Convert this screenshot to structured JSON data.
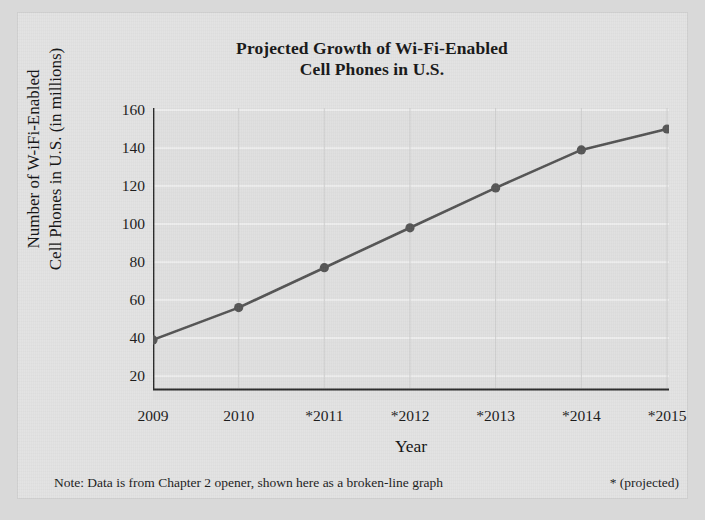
{
  "title": {
    "line1": "Projected Growth of Wi-Fi-Enabled",
    "line2": "Cell Phones in U.S."
  },
  "axes": {
    "y_label_line1": "Number of W-iFi-Enabled",
    "y_label_line2": "Cell Phones in U.S. (in millions)",
    "x_label": "Year"
  },
  "footer": {
    "note": "Note: Data is from Chapter 2 opener, shown here as a broken-line graph",
    "projected_key": "* (projected)"
  },
  "style": {
    "line_color": "#545454",
    "marker_color": "#555555",
    "axis_color": "#2b2b2b",
    "gridline_color": "#f2f2f2",
    "plot_background": "#e0e0e0",
    "page_background": "#d9d9d9"
  },
  "chart_data": {
    "type": "line",
    "title": "Projected Growth of Wi-Fi-Enabled Cell Phones in U.S.",
    "xlabel": "Year",
    "ylabel": "Number of W-iFi-Enabled Cell Phones in U.S. (in millions)",
    "categories": [
      "2009",
      "2010",
      "*2011",
      "*2012",
      "*2013",
      "*2014",
      "*2015"
    ],
    "values": [
      39,
      56,
      77,
      98,
      119,
      139,
      150
    ],
    "ylim": [
      20,
      160
    ],
    "yticks": [
      20,
      40,
      60,
      80,
      100,
      120,
      140,
      160
    ],
    "ytick_labels": [
      "20",
      "40",
      "60",
      "80",
      "100",
      "120",
      "140",
      "160"
    ],
    "xtick_labels": [
      "2009",
      "2010",
      "*2011",
      "*2012",
      "*2013",
      "*2014",
      "*2015"
    ],
    "grid": true,
    "grid_axis": "both",
    "legend": false,
    "markers": "circle",
    "series": [
      {
        "name": "Wi-Fi-enabled cell phones (millions)",
        "values": [
          39,
          56,
          77,
          98,
          119,
          139,
          150
        ]
      }
    ],
    "annotations": [
      "* (projected)",
      "Note: Data is from Chapter 2 opener, shown here as a broken-line graph"
    ]
  }
}
